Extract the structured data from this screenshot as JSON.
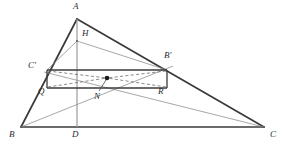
{
  "figure": {
    "type": "geometry-diagram",
    "background_color": "#ffffff",
    "stroke_colors": {
      "thick": "#3a3a3a",
      "thin": "#8a8a8a",
      "dashed": "#6e6e6e",
      "point": "#1a1a1a",
      "label": "#2b2b2b"
    },
    "points": [
      {
        "id": "A",
        "label": "A",
        "x": 77,
        "y": 19,
        "label_x": 73,
        "label_y": 4
      },
      {
        "id": "B",
        "label": "B",
        "x": 21,
        "y": 127,
        "label_x": 9,
        "label_y": 131
      },
      {
        "id": "C",
        "label": "C",
        "x": 264,
        "y": 127,
        "label_x": 270,
        "label_y": 131
      },
      {
        "id": "D",
        "label": "D",
        "x": 77,
        "y": 127,
        "label_x": 72,
        "label_y": 131
      },
      {
        "id": "H",
        "label": "H",
        "x": 77,
        "y": 41,
        "label_x": 82,
        "label_y": 30
      },
      {
        "id": "Cp",
        "label": "C'",
        "x": 47,
        "y": 70,
        "label_x": 29,
        "label_y": 62
      },
      {
        "id": "Bp",
        "label": "B'",
        "x": 167,
        "y": 70,
        "label_x": 165,
        "label_y": 53
      },
      {
        "id": "Q",
        "label": "Q",
        "x": 47,
        "y": 88,
        "label_x": 39,
        "label_y": 89
      },
      {
        "id": "R",
        "label": "R",
        "x": 167,
        "y": 88,
        "label_x": 159,
        "label_y": 89
      },
      {
        "id": "N",
        "label": "N",
        "x": 107,
        "y": 78,
        "label_x": 95,
        "label_y": 95
      }
    ],
    "segments": [
      {
        "name": "side-AB",
        "from": "A",
        "to": "B",
        "style": "thick"
      },
      {
        "name": "side-AC",
        "from": "A",
        "to": "C",
        "style": "thick"
      },
      {
        "name": "base-BC",
        "from": "B",
        "to": "C",
        "style": "thick"
      },
      {
        "name": "altitude-AD",
        "from": "A",
        "to": "D",
        "style": "thin"
      },
      {
        "name": "rect-top-CpBp",
        "from": "Cp",
        "to": "Bp",
        "style": "thick"
      },
      {
        "name": "rect-bottom-QR",
        "from": "Q",
        "to": "R",
        "style": "thick"
      },
      {
        "name": "rect-left-CpQ",
        "from": "Cp",
        "to": "Q",
        "style": "thick"
      },
      {
        "name": "rect-right-BpR",
        "from": "Bp",
        "to": "R",
        "style": "thick"
      },
      {
        "name": "line-H-Cp",
        "from": "H",
        "to": "Cp",
        "style": "thin"
      },
      {
        "name": "line-H-Bp",
        "from": "H",
        "to": "Bp",
        "style": "thin"
      },
      {
        "name": "line-B-Bp-ext",
        "from": "B",
        "to": "Bp",
        "style": "thin"
      },
      {
        "name": "line-Cp-C-ext",
        "from": "Cp",
        "to": "C",
        "style": "thin"
      },
      {
        "name": "leader-N",
        "from": "N",
        "to": "N",
        "style": "leader"
      }
    ],
    "dashed_segments": [
      {
        "name": "dashed-Cp-N",
        "from": "Cp",
        "to": "N"
      },
      {
        "name": "dashed-Bp-N",
        "from": "Bp",
        "to": "N"
      },
      {
        "name": "dashed-Q-N",
        "from": "Q",
        "to": "N"
      },
      {
        "name": "dashed-R-N",
        "from": "R",
        "to": "N"
      }
    ],
    "marked_point": {
      "name": "point-N-dot",
      "x": 107,
      "y": 78,
      "radius": 2.2
    },
    "leader_line": {
      "name": "leader-line-N",
      "x1": 99,
      "y1": 91,
      "x2": 106,
      "y2": 81
    }
  }
}
